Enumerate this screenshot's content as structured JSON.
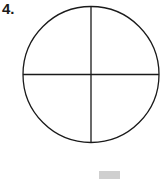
{
  "problem": {
    "number_label": "4."
  },
  "figure": {
    "shape": "circle",
    "divisions": 4,
    "division_lines": [
      "vertical-diameter",
      "horizontal-diameter"
    ],
    "stroke_color": "#1a1a1a",
    "fill_color": "#ffffff"
  },
  "answer_box": {
    "color": "#cfcfcf"
  }
}
